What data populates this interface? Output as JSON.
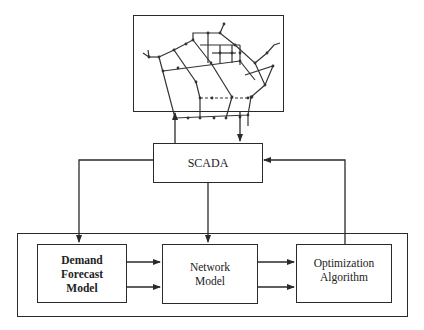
{
  "diagram": {
    "network_map": {
      "name": "Water distribution network schematic"
    },
    "nodes": {
      "scada": {
        "label": "SCADA"
      },
      "demand_forecast": {
        "label_lines": [
          "Demand",
          "Forecast",
          "Model"
        ]
      },
      "network_model": {
        "label_lines": [
          "Network",
          "Model"
        ]
      },
      "optimization": {
        "label_lines": [
          "Optimization",
          "Algorithm"
        ]
      }
    },
    "edges": [
      {
        "from": "scada",
        "to": "network_map"
      },
      {
        "from": "network_map",
        "to": "scada"
      },
      {
        "from": "scada",
        "to": "demand_forecast"
      },
      {
        "from": "scada",
        "to": "network_model"
      },
      {
        "from": "optimization",
        "to": "scada"
      },
      {
        "from": "demand_forecast",
        "to": "network_model",
        "count": 2
      },
      {
        "from": "network_model",
        "to": "optimization",
        "count": 2
      }
    ],
    "colors": {
      "stroke": "#2a2a2a",
      "background": "#ffffff"
    }
  }
}
